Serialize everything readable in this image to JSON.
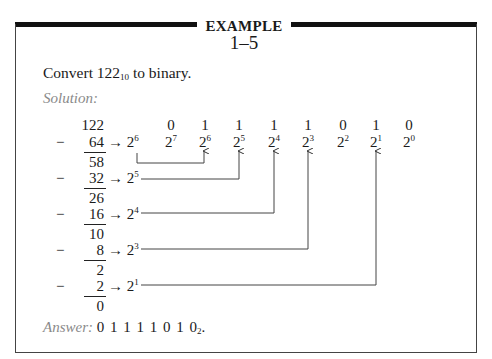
{
  "header": {
    "title": "EXAMPLE",
    "number": "1–5"
  },
  "problem": {
    "prefix": "Convert ",
    "value": "122",
    "base": "10",
    "suffix": " to binary."
  },
  "solution_label": "Solution:",
  "subtraction": {
    "start": "122",
    "steps": [
      {
        "minus": "−",
        "subtrahend": "64",
        "arrow": "→",
        "power_base": "2",
        "power_exp": "6",
        "remainder": "58"
      },
      {
        "minus": "−",
        "subtrahend": "32",
        "arrow": "→",
        "power_base": "2",
        "power_exp": "5",
        "remainder": "26"
      },
      {
        "minus": "−",
        "subtrahend": "16",
        "arrow": "→",
        "power_base": "2",
        "power_exp": "4",
        "remainder": "10"
      },
      {
        "minus": "−",
        "subtrahend": "8",
        "arrow": "→",
        "power_base": "2",
        "power_exp": "3",
        "remainder": "2"
      },
      {
        "minus": "−",
        "subtrahend": "2",
        "arrow": "→",
        "power_base": "2",
        "power_exp": "1",
        "remainder": "0"
      }
    ]
  },
  "columns": [
    {
      "bit": "0",
      "base": "2",
      "exp": "7"
    },
    {
      "bit": "1",
      "base": "2",
      "exp": "6"
    },
    {
      "bit": "1",
      "base": "2",
      "exp": "5"
    },
    {
      "bit": "1",
      "base": "2",
      "exp": "4"
    },
    {
      "bit": "1",
      "base": "2",
      "exp": "3"
    },
    {
      "bit": "0",
      "base": "2",
      "exp": "2"
    },
    {
      "bit": "1",
      "base": "2",
      "exp": "1"
    },
    {
      "bit": "0",
      "base": "2",
      "exp": "0"
    }
  ],
  "answer": {
    "label": "Answer:",
    "bits": "0 1 1 1 1 0 1 0",
    "base": "2",
    "suffix": "."
  }
}
